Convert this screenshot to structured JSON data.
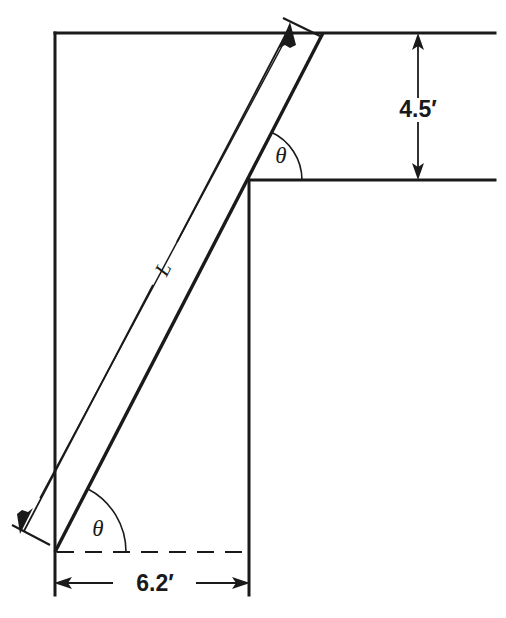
{
  "figure": {
    "kind": "engineering-diagram",
    "background_color": "#ffffff",
    "line_color": "#1a1a1a"
  },
  "labels": {
    "height_dimension": "4.5′",
    "base_dimension": "6.2′",
    "ladder_length": "L",
    "angle_upper": "θ",
    "angle_lower": "θ"
  },
  "geometry": {
    "wall_top_y": 33,
    "wall_left_x": 55,
    "ledge_top_y": 180,
    "ledge_corner_x": 249,
    "ground_y": 552,
    "right_edge_x": 495,
    "ladder_foot": {
      "x": 55,
      "y": 552
    },
    "ladder_top": {
      "x": 323,
      "y": 33
    },
    "dim_arrow_top": {
      "x": 290,
      "y": 25
    },
    "dim_arrow_bottom": {
      "x": 22,
      "y": 528
    },
    "height_arrow_x": 418,
    "height_arrow_top_y": 36,
    "height_arrow_bottom_y": 178,
    "base_arrow_y": 583,
    "base_arrow_left_x": 56,
    "base_arrow_right_x": 248
  }
}
